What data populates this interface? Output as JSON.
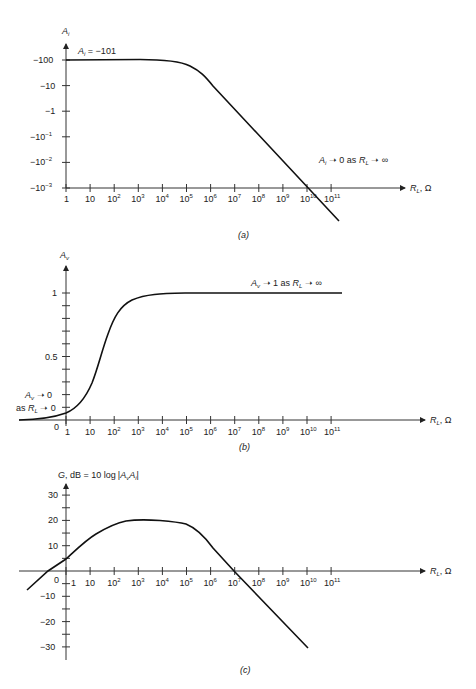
{
  "chart_data": [
    {
      "id": "a",
      "type": "line",
      "caption": "(a)",
      "ylabel": "A_i",
      "xlabel": "R_L, Ω",
      "x_scale": "log",
      "x_ticks": [
        "1",
        "10",
        "10^2",
        "10^3",
        "10^4",
        "10^5",
        "10^6",
        "10^7",
        "10^8",
        "10^9",
        "10^10",
        "10^11"
      ],
      "y_ticks": [
        "-100",
        "-10",
        "-1",
        "-10^-1",
        "-10^-2",
        "-10^-3"
      ],
      "annotations": [
        "A_i = -101",
        "A_i → 0 as R_L → ∞"
      ],
      "series": [
        {
          "name": "A_i",
          "x_log10": [
            0,
            2,
            4,
            5,
            5.5,
            6,
            7,
            8,
            9,
            10,
            10.5
          ],
          "y_log10_magnitude": [
            2.0,
            2.0,
            1.98,
            1.9,
            1.75,
            1.5,
            0.5,
            -0.5,
            -1.5,
            -2.5,
            -3.0
          ]
        }
      ]
    },
    {
      "id": "b",
      "type": "line",
      "caption": "(b)",
      "ylabel": "A_v",
      "xlabel": "R_L, Ω",
      "x_scale": "log",
      "x_ticks": [
        "1",
        "10",
        "10^2",
        "10^3",
        "10^4",
        "10^5",
        "10^6",
        "10^7",
        "10^8",
        "10^9",
        "10^10",
        "10^11"
      ],
      "y_ticks": [
        "0",
        "0.5",
        "1"
      ],
      "ylim": [
        0,
        1
      ],
      "annotations": [
        "A_v → 1 as R_L → ∞",
        "A_v → 0",
        "as R_L → 0"
      ],
      "series": [
        {
          "name": "A_v",
          "x_log10": [
            -2,
            0,
            0.5,
            1,
            1.5,
            2,
            2.5,
            3,
            4,
            5,
            11
          ],
          "values": [
            0.0,
            0.06,
            0.13,
            0.27,
            0.5,
            0.79,
            0.9,
            0.95,
            0.99,
            1.0,
            1.0
          ]
        }
      ]
    },
    {
      "id": "c",
      "type": "line",
      "caption": "(c)",
      "ylabel": "G, dB = 10 log|A_v A_i|",
      "xlabel": "R_L, Ω",
      "x_scale": "log",
      "x_ticks": [
        "1",
        "10",
        "10^2",
        "10^3",
        "10^4",
        "10^5",
        "10^6",
        "10^7",
        "10^8",
        "10^9",
        "10^10",
        "10^11"
      ],
      "y_ticks": [
        "30",
        "20",
        "10",
        "0",
        "-10",
        "-20",
        "-30"
      ],
      "ylim": [
        -35,
        35
      ],
      "series": [
        {
          "name": "G",
          "x_log10": [
            -1.6,
            -0.75,
            0,
            1,
            2,
            3,
            4,
            5,
            6,
            7,
            8,
            9,
            10
          ],
          "values": [
            -8,
            0,
            5,
            14,
            19,
            20,
            19.5,
            18,
            10,
            0,
            -10,
            -20,
            -30
          ]
        }
      ]
    }
  ],
  "labels": {
    "a": {
      "ylabel_main": "A",
      "ylabel_sub": "i",
      "note1_main": "A",
      "note1_sub": "i",
      "note1_rest": " = −101",
      "note2_main": "A",
      "note2_sub": "i",
      "note2_rest": " ➝ 0 as ",
      "note2_r": "R",
      "note2_rsub": "L",
      "note2_end": " ➝ ∞",
      "y_ticks": [
        "−100",
        "−10",
        "−1",
        "−10",
        "−10",
        "−10"
      ],
      "y_exps": [
        "",
        "",
        "",
        "−1",
        "−2",
        "−3"
      ],
      "caption": "(a)"
    },
    "b": {
      "ylabel_main": "A",
      "ylabel_sub": "v",
      "note1": "A",
      "note1_sub": "v",
      "note1_rest": " ➝ 1 as ",
      "note1_r": "R",
      "note1_rsub": "L",
      "note1_end": " ➝ ∞",
      "left1_main": "A",
      "left1_sub": "v",
      "left1_rest": " ➝ 0",
      "left2_pre": "as ",
      "left2_r": "R",
      "left2_rsub": "L",
      "left2_rest": " ➝ 0",
      "y_one": "1",
      "y_half": "0.5",
      "y_zero": "0",
      "caption": "(b)"
    },
    "c": {
      "ylabel_g": "G",
      "ylabel_rest": ", dB = 10 log",
      "ylabel_a1": "A",
      "ylabel_a1sub": "v",
      "ylabel_a2": "A",
      "ylabel_a2sub": "i",
      "y_ticks": [
        "30",
        "20",
        "10",
        "0",
        "−10",
        "−20",
        "−30"
      ],
      "caption": "(c)"
    },
    "xaxis": {
      "r": "R",
      "rsub": "L",
      "unit": ", Ω",
      "one": "1",
      "ten": "10",
      "base": "10",
      "exps": [
        "2",
        "3",
        "4",
        "5",
        "6",
        "7",
        "8",
        "9",
        "10",
        "11"
      ]
    }
  }
}
